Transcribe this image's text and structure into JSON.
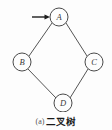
{
  "figure": {
    "caption_index": "(a)",
    "caption_text": "二叉树",
    "background_color": "#fdfdfd",
    "stroke_color": "#555555",
    "label_color": "#3a3a3a",
    "arrow_color": "#1d1d1d"
  },
  "graph": {
    "nodes": [
      {
        "id": "A",
        "label": "A",
        "cx": 59,
        "cy": 17,
        "r": 9
      },
      {
        "id": "B",
        "label": "B",
        "cx": 22,
        "cy": 62,
        "r": 9
      },
      {
        "id": "C",
        "label": "C",
        "cx": 94,
        "cy": 62,
        "r": 9
      },
      {
        "id": "D",
        "label": "D",
        "cx": 63,
        "cy": 103,
        "r": 9
      }
    ],
    "edges": [
      {
        "from": "A",
        "to": "B",
        "x1": 52,
        "y1": 23,
        "x2": 29,
        "y2": 56
      },
      {
        "from": "A",
        "to": "C",
        "x1": 66,
        "y1": 23,
        "x2": 87,
        "y2": 56
      },
      {
        "from": "B",
        "to": "D",
        "x1": 28,
        "y1": 69,
        "x2": 56,
        "y2": 98
      },
      {
        "from": "C",
        "to": "D",
        "x1": 88,
        "y1": 69,
        "x2": 70,
        "y2": 98
      }
    ],
    "arrow": {
      "name": "root-pointer-arrow",
      "x1": 32,
      "y1": 17,
      "x2": 49,
      "y2": 17,
      "points_to": "A"
    }
  }
}
